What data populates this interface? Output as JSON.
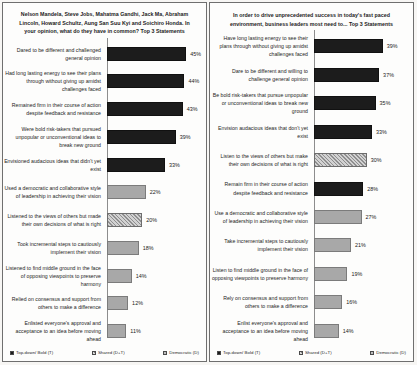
{
  "chart_data": [
    {
      "type": "bar",
      "orientation": "horizontal",
      "title": "Nelson Mandela, Steve Jobs, Mahatma Gandhi, Jack Ma, Abraham Lincoln, Howard Schultz, Aung San Suu Kyi and Soichiro Honda. In your opinion, what do they have in common? Top 3 Statements",
      "xlabel": "",
      "ylabel": "",
      "xlim": [
        0,
        50
      ],
      "grid": false,
      "legend_position": "bottom",
      "categories": [
        "Dared to be different and challenged general opinion",
        "Had long lasting energy to see their plans through without giving up amidst challenges faced",
        "Remained firm in their course of action despite feedback and resistance",
        "Were bold risk-takers that pursued unpopular or unconventional ideas to break new ground",
        "Envisioned audacious  ideas that didn't yet exist",
        "Used a democratic and collaborative style of leadership  in achieving their vision",
        "Listened to the views of others but made their own decisions of what is right",
        "Took incremental steps to cautiously implement their vision",
        "Listened to find middle ground in the face of opposing viewpoints to preserve harmony",
        "Relied on consensus and support from others to make a difference",
        "Enlisted everyone's approval and acceptance to an idea before moving ahead"
      ],
      "values": [
        45,
        44,
        43,
        39,
        33,
        22,
        20,
        18,
        14,
        12,
        11
      ],
      "value_labels": [
        "45%",
        "44%",
        "43%",
        "39%",
        "33%",
        "22%",
        "20%",
        "18%",
        "14%",
        "12%",
        "11%"
      ],
      "series_keys": [
        "T",
        "T",
        "T",
        "T",
        "T",
        "D",
        "DT",
        "D",
        "D",
        "D",
        "D"
      ]
    },
    {
      "type": "bar",
      "orientation": "horizontal",
      "title": "In order to drive unprecedented success in today's fast paced environment, business leaders most need to... Top 3 Statements",
      "xlabel": "",
      "ylabel": "",
      "xlim": [
        0,
        50
      ],
      "grid": false,
      "legend_position": "bottom",
      "categories": [
        "Have long lasting energy to see their plans through without giving up amidst challenges faced",
        "Dare to be different and willing to challenge  general opinion",
        "Be bold risk-takers  that pursue unpopular or unconventional ideas to break new ground",
        "Envision audacious ideas that don't yet exist",
        "Listen to the views of others but make their own decisions of what is right",
        "Remain firm in their course of action despite feedback and resistance",
        "Use a democratic and collaborative style of leadership  in achieving their vision",
        "Take incremental steps to cautiously implement their vision",
        "Listen to find middle ground in the face of opposing viewpoints  to preserve harmony",
        "Rely on consensus and support from others to make a difference",
        "Enlist everyone's approval and acceptance to an idea before moving ahead"
      ],
      "values": [
        39,
        37,
        35,
        33,
        30,
        28,
        27,
        21,
        19,
        16,
        14
      ],
      "value_labels": [
        "39%",
        "37%",
        "35%",
        "33%",
        "30%",
        "28%",
        "27%",
        "21%",
        "19%",
        "16%",
        "14%"
      ],
      "series_keys": [
        "T",
        "T",
        "T",
        "T",
        "DT",
        "T",
        "D",
        "D",
        "D",
        "D",
        "D"
      ]
    }
  ],
  "legend": [
    {
      "key": "T",
      "label": "Top-down/ Bold (T)",
      "color": "#1c1c1c"
    },
    {
      "key": "DT",
      "label": "Shared (D+T)",
      "color": "#b9b9b9"
    },
    {
      "key": "D",
      "label": "Democratic (D)",
      "color": "#a8a8a8"
    }
  ]
}
